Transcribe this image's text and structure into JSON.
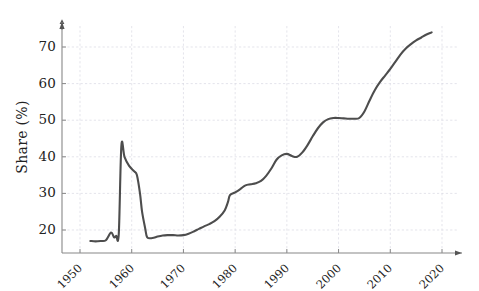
{
  "chart_data": {
    "type": "line",
    "title": "",
    "xlabel": "",
    "ylabel": "Share (%)",
    "xlim": [
      1948,
      2024
    ],
    "ylim": [
      14,
      78
    ],
    "grid": true,
    "legend": "none",
    "xticks": [
      1950,
      1960,
      1970,
      1980,
      1990,
      2000,
      2010,
      2020
    ],
    "xtick_labels": [
      "1950",
      "1960",
      "1970",
      "1980",
      "1990",
      "2000",
      "2010",
      "2020"
    ],
    "yticks": [
      20,
      30,
      40,
      50,
      60,
      70
    ],
    "ytick_labels": [
      "20",
      "30",
      "40",
      "50",
      "60",
      "70"
    ],
    "line_color": "#4d4d4d",
    "series": [
      {
        "name": "Share",
        "x": [
          1952,
          1953,
          1954,
          1955,
          1956,
          1956.6,
          1957,
          1957.5,
          1958,
          1958.6,
          1959.5,
          1960.5,
          1961,
          1961.6,
          1962,
          1962.6,
          1963,
          1964,
          1965,
          1966,
          1967,
          1968,
          1969,
          1970,
          1971,
          1972,
          1973,
          1974,
          1975,
          1976,
          1977,
          1978,
          1978.6,
          1979,
          1980,
          1981,
          1982,
          1983,
          1984,
          1985,
          1986,
          1987,
          1988,
          1989,
          1990,
          1991,
          1992,
          1993,
          1994,
          1995,
          1996,
          1997,
          1998,
          1999,
          2000,
          2001,
          2002,
          2003,
          2004,
          2005,
          2006,
          2007,
          2008,
          2009,
          2010,
          2011,
          2012,
          2013,
          2014,
          2015,
          2016,
          2017,
          2018
        ],
        "y": [
          17.0,
          16.9,
          17.0,
          17.2,
          19.3,
          18.0,
          18.4,
          19.0,
          43.0,
          40.0,
          37.5,
          36.0,
          35.0,
          30.0,
          25.0,
          20.5,
          18.0,
          17.8,
          18.2,
          18.5,
          18.6,
          18.6,
          18.5,
          18.6,
          19.0,
          19.6,
          20.3,
          21.0,
          21.6,
          22.4,
          23.6,
          25.4,
          27.6,
          29.5,
          30.3,
          31.2,
          32.2,
          32.5,
          32.8,
          33.4,
          34.8,
          36.8,
          39.2,
          40.4,
          40.8,
          40.2,
          40.0,
          41.2,
          43.2,
          45.6,
          47.8,
          49.4,
          50.3,
          50.6,
          50.6,
          50.5,
          50.4,
          50.4,
          50.6,
          52.4,
          55.4,
          58.2,
          60.4,
          62.2,
          64.0,
          66.0,
          68.0,
          69.6,
          70.8,
          71.8,
          72.6,
          73.4,
          74.0
        ]
      }
    ]
  }
}
